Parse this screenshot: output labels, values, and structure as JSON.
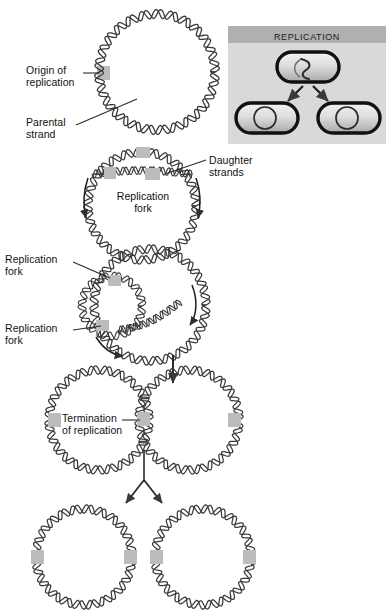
{
  "figure": {
    "type": "diagram",
    "background_color": "#ffffff",
    "stroke_color": "#3a3a3a",
    "origin_marker_color": "#b8b8b8"
  },
  "inset": {
    "header_label": "REPLICATION",
    "header_bg": "#b0b0b0",
    "body_bg": "#d9d9d9",
    "cells": [
      {
        "name": "parent-cell",
        "dna": "theta-replicating-chromosome"
      },
      {
        "name": "daughter-cell-left",
        "dna": "circular-chromosome"
      },
      {
        "name": "daughter-cell-right",
        "dna": "circular-chromosome"
      }
    ],
    "arrows": 2
  },
  "labels": {
    "origin_of_replication": "Origin of\nreplication",
    "parental_strand": "Parental\nstrand",
    "daughter_strands": "Daughter\nstrands",
    "replication_fork_stage2": "Replication\nfork",
    "replication_fork_upper": "Replication\nfork",
    "replication_fork_lower": "Replication\nfork",
    "termination_of_replication": "Termination\nof replication"
  },
  "stages": [
    {
      "id": "stage-1",
      "name": "parental-circular-chromosome",
      "description": "Single circular double-stranded DNA molecule with origin of replication"
    },
    {
      "id": "stage-2",
      "name": "replication-initiation-bubble",
      "description": "Replication bubble formed at origin; two replication forks move in opposite directions"
    },
    {
      "id": "stage-3",
      "name": "theta-structure",
      "description": "Theta-shaped intermediate with two replication forks advancing around the circle"
    },
    {
      "id": "stage-4",
      "name": "termination",
      "description": "Two interlocked daughter chromosomes meet at the termination site"
    },
    {
      "id": "stage-5",
      "name": "separated-daughter-chromosomes",
      "description": "Two separate identical circular daughter chromosomes"
    }
  ]
}
